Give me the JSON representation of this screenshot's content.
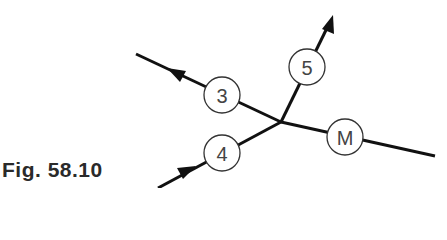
{
  "figure": {
    "caption": "Fig. 58.10",
    "junction": {
      "x": 281,
      "y": 122
    },
    "branches": [
      {
        "id": "3",
        "label": "3",
        "direction": "outflow",
        "end": {
          "x": 136,
          "y": 54
        },
        "node": {
          "x": 222,
          "y": 95
        }
      },
      {
        "id": "5",
        "label": "5",
        "direction": "outflow",
        "end": {
          "x": 333,
          "y": 16
        },
        "node": {
          "x": 307,
          "y": 67
        }
      },
      {
        "id": "M",
        "label": "M",
        "direction": "none",
        "end": {
          "x": 435,
          "y": 156
        },
        "node": {
          "x": 345,
          "y": 137
        }
      },
      {
        "id": "4",
        "label": "4",
        "direction": "inflow",
        "end": {
          "x": 158,
          "y": 188
        },
        "node": {
          "x": 222,
          "y": 153
        }
      }
    ],
    "colors": {
      "line": "#111111",
      "node_stroke": "#333333",
      "text": "#444444"
    }
  }
}
